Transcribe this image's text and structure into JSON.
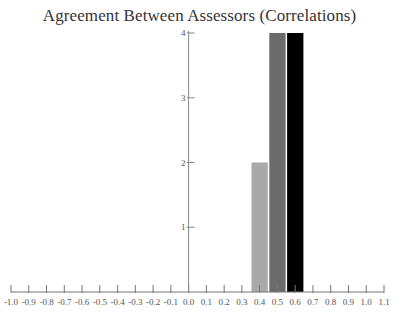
{
  "chart_data": {
    "type": "bar",
    "title": "Agreement Between Assessors (Correlations)",
    "xlabel": "",
    "ylabel": "",
    "xlim": [
      -1.0,
      1.1
    ],
    "ylim": [
      0,
      4
    ],
    "grid": false,
    "legend": null,
    "x_ticks": [
      "-1.0",
      "-0.9",
      "-0.8",
      "-0.7",
      "-0.6",
      "-0.5",
      "-0.4",
      "-0.3",
      "-0.2",
      "-0.1",
      "0.0",
      "0.1",
      "0.2",
      "0.3",
      "0.4",
      "0.5",
      "0.6",
      "0.7",
      "0.8",
      "0.9",
      "1.0",
      "1.1"
    ],
    "y_ticks": [
      "1",
      "2",
      "3",
      "4"
    ],
    "categories": [
      "0.4",
      "0.5",
      "0.6"
    ],
    "values": [
      2,
      4,
      4
    ],
    "bar_colors": [
      "#a9a9a9",
      "#6b6b6b",
      "#000000"
    ]
  }
}
